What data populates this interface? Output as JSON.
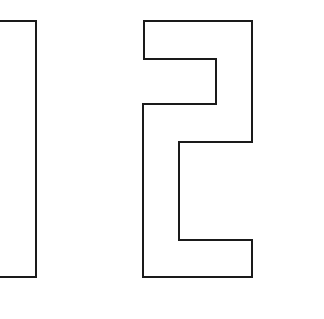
{
  "content": {
    "text": "12",
    "glyphs": [
      {
        "char": "1",
        "style": "outline"
      },
      {
        "char": "2",
        "style": "outline"
      }
    ]
  },
  "colors": {
    "background": "#ffffff",
    "stroke": "#1a1a1a"
  }
}
